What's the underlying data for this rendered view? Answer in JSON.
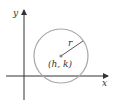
{
  "figure": {
    "axes": {
      "x_label": "x",
      "y_label": "y"
    },
    "circle": {
      "center_label": "(h, k)",
      "radius_label": "r",
      "stroke_color": "#a8a8a8"
    },
    "colors": {
      "axis": "#333333",
      "radius_line": "#444444",
      "text": "#333333"
    }
  }
}
